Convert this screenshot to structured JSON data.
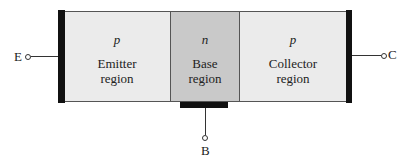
{
  "diagram": {
    "regions": [
      {
        "type": "p",
        "name_line1": "Emitter",
        "name_line2": "region"
      },
      {
        "type": "n",
        "name_line1": "Base",
        "name_line2": "region"
      },
      {
        "type": "p",
        "name_line1": "Collector",
        "name_line2": "region"
      }
    ],
    "terminals": {
      "emitter": "E",
      "base": "B",
      "collector": "C"
    },
    "colors": {
      "p_region": "#ebebeb",
      "n_region": "#c9c9c9",
      "contact": "#111111"
    }
  }
}
